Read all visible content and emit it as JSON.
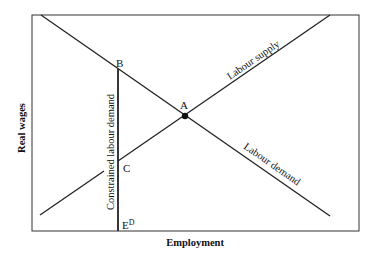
{
  "diagram": {
    "axes": {
      "y_label": "Real wages",
      "x_label": "Employment"
    },
    "curves": {
      "supply_label": "Labour supply",
      "demand_label": "Labour demand",
      "constrained_label": "Constrained labour demand"
    },
    "points": {
      "A": "A",
      "B": "B",
      "C": "C",
      "ED_base": "E",
      "ED_sup": "D"
    },
    "colors": {
      "line": "#222222",
      "background": "#ffffff"
    }
  }
}
